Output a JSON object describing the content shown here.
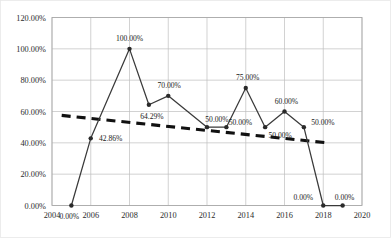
{
  "chart_data": {
    "type": "line",
    "title": "",
    "xlabel": "",
    "ylabel": "",
    "grid": true,
    "legend": "none",
    "xlim": [
      2004,
      2020
    ],
    "ylim": [
      0,
      1.2
    ],
    "x_ticks": [
      "2004",
      "2006",
      "2008",
      "2010",
      "2012",
      "2014",
      "2016",
      "2018",
      "2020"
    ],
    "y_ticks": [
      "0.00%",
      "20.00%",
      "40.00%",
      "60.00%",
      "80.00%",
      "100.00%",
      "120.00%"
    ],
    "x": [
      2005,
      2006,
      2008,
      2009,
      2010,
      2012,
      2013,
      2014,
      2015,
      2016,
      2017,
      2018,
      2019
    ],
    "values": [
      0,
      42.86,
      100,
      64.29,
      70,
      50,
      50,
      75,
      50,
      60,
      50,
      0,
      0
    ],
    "point_labels": [
      "0.00%",
      "42.86%",
      "100.00%",
      "64.29%",
      "70.00%",
      "50.00%",
      "50.00%",
      "75.00%",
      "50.00%",
      "60.00%",
      "50.00%",
      "0.00%",
      "0.00%"
    ],
    "series": [
      {
        "name": "data",
        "values": [
          0,
          42.86,
          100,
          64.29,
          70,
          50,
          50,
          75,
          50,
          60,
          50,
          0,
          0
        ]
      },
      {
        "name": "linear-trendline",
        "style": "dashed",
        "start": {
          "x": 2004.5,
          "y": 57.5
        },
        "end": {
          "x": 2018.2,
          "y": 40.0
        }
      }
    ],
    "colors": {
      "series_line": "#3a3a3a",
      "trend_line": "#111111",
      "grid": "#bfbfbf",
      "frame": "#a6a6a6",
      "background": "#ffffff"
    }
  },
  "axis_labels": {
    "y": [
      {
        "text": "120.00%",
        "value": 120
      },
      {
        "text": "100.00%",
        "value": 100
      },
      {
        "text": "80.00%",
        "value": 80
      },
      {
        "text": "60.00%",
        "value": 60
      },
      {
        "text": "40.00%",
        "value": 40
      },
      {
        "text": "20.00%",
        "value": 20
      },
      {
        "text": "0.00%",
        "value": 0
      }
    ],
    "x": [
      {
        "text": "2004",
        "value": 2004
      },
      {
        "text": "2006",
        "value": 2006
      },
      {
        "text": "2008",
        "value": 2008
      },
      {
        "text": "2010",
        "value": 2010
      },
      {
        "text": "2012",
        "value": 2012
      },
      {
        "text": "2014",
        "value": 2014
      },
      {
        "text": "2016",
        "value": 2016
      },
      {
        "text": "2018",
        "value": 2018
      },
      {
        "text": "2020",
        "value": 2020
      }
    ]
  },
  "data_labels": [
    {
      "text": "0.00%",
      "x": 2005,
      "y": 0,
      "dx": -2,
      "dy": 13
    },
    {
      "text": "42.86%",
      "x": 2006,
      "y": 42.86,
      "dx": 20,
      "dy": 3
    },
    {
      "text": "100.00%",
      "x": 2008,
      "y": 100,
      "dx": 0,
      "dy": -8
    },
    {
      "text": "64.29%",
      "x": 2009,
      "y": 64.29,
      "dx": 3,
      "dy": 14
    },
    {
      "text": "70.00%",
      "x": 2010,
      "y": 70,
      "dx": 1,
      "dy": -8
    },
    {
      "text": "50.00%",
      "x": 2012,
      "y": 50,
      "dx": 10,
      "dy": -5
    },
    {
      "text": "50.00%",
      "x": 2013,
      "y": 50,
      "dx": 14,
      "dy": -2
    },
    {
      "text": "75.00%",
      "x": 2014,
      "y": 75,
      "dx": 2,
      "dy": -8
    },
    {
      "text": "50.00%",
      "x": 2015,
      "y": 50,
      "dx": 15,
      "dy": 11
    },
    {
      "text": "60.00%",
      "x": 2016,
      "y": 60,
      "dx": 2,
      "dy": -8
    },
    {
      "text": "50.00%",
      "x": 2017,
      "y": 50,
      "dx": 19,
      "dy": -2
    },
    {
      "text": "0.00%",
      "x": 2018,
      "y": 0,
      "dx": -20,
      "dy": -6
    },
    {
      "text": "0.00%",
      "x": 2019,
      "y": 0,
      "dx": 2,
      "dy": -6
    }
  ]
}
